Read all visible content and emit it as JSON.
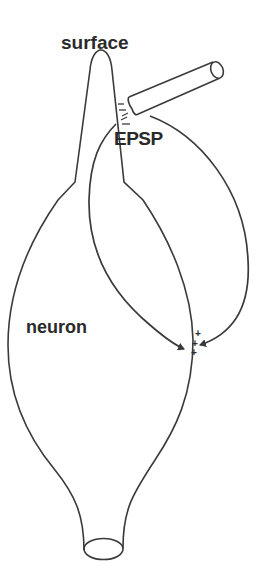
{
  "labels": {
    "surface": "surface",
    "epsp": "EPSP",
    "neuron": "neuron"
  },
  "charges": {
    "negative": [
      "–",
      "–",
      "–"
    ],
    "positive": [
      "+",
      "+",
      "+"
    ]
  },
  "colors": {
    "stroke": "#3a3a3a",
    "text": "#2a2a2a",
    "background": "#ffffff"
  },
  "elements": [
    "neuron-outline",
    "dendrite",
    "axon-hillock",
    "axon-cut-ellipse",
    "electrode-pipette",
    "current-loop-inner-arrow",
    "current-loop-outer-arrow"
  ]
}
